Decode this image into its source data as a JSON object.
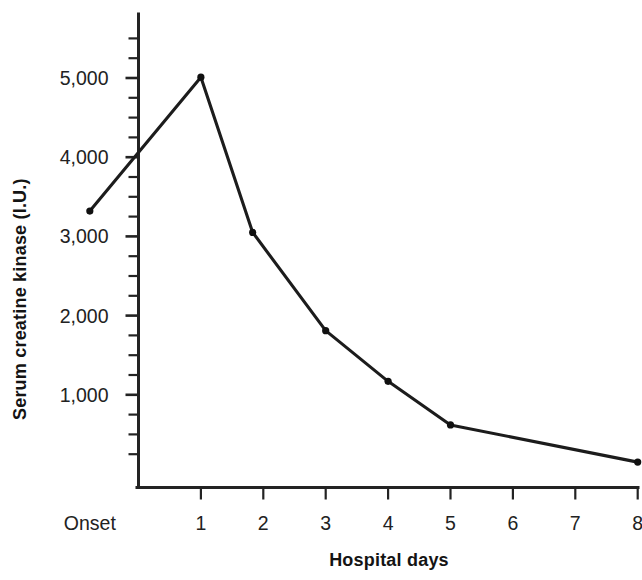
{
  "chart_data": {
    "type": "line",
    "title": "",
    "xlabel": "Hospital days",
    "ylabel": "Serum creatine kinase (I.U.)",
    "xlim": [
      -0.78,
      8.0
    ],
    "ylim": [
      0,
      5550
    ],
    "grid": false,
    "legend": null,
    "x_tick_labels": [
      "Onset",
      "1",
      "2",
      "3",
      "4",
      "5",
      "6",
      "7",
      "8"
    ],
    "x_tick_values": [
      -0.78,
      1,
      2,
      3,
      4,
      5,
      6,
      7,
      8
    ],
    "y_tick_labels": [
      "1,000",
      "2,000",
      "3,000",
      "4,000",
      "5,000"
    ],
    "y_tick_values": [
      1000,
      2000,
      3000,
      4000,
      5000
    ],
    "y_minor_step": 250,
    "series": [
      {
        "name": "Serum creatine kinase",
        "marker": "dot",
        "x": [
          -0.78,
          1.0,
          1.83,
          3.0,
          4.0,
          5.0,
          8.0
        ],
        "y": [
          3320,
          5010,
          3050,
          1810,
          1170,
          620,
          150
        ],
        "x_labels": [
          "Onset",
          "1",
          "1.8",
          "3",
          "4",
          "5",
          "8"
        ]
      }
    ]
  },
  "axes": {
    "y_title": "Serum creatine kinase (I.U.)",
    "x_title": "Hospital days"
  },
  "ticks": {
    "y": [
      {
        "label": "5,000",
        "value": 5000
      },
      {
        "label": "4,000",
        "value": 4000
      },
      {
        "label": "3,000",
        "value": 3000
      },
      {
        "label": "2,000",
        "value": 2000
      },
      {
        "label": "1,000",
        "value": 1000
      }
    ],
    "x": [
      {
        "label": "Onset",
        "value": -0.78
      },
      {
        "label": "1",
        "value": 1
      },
      {
        "label": "2",
        "value": 2
      },
      {
        "label": "3",
        "value": 3
      },
      {
        "label": "4",
        "value": 4
      },
      {
        "label": "5",
        "value": 5
      },
      {
        "label": "6",
        "value": 6
      },
      {
        "label": "7",
        "value": 7
      },
      {
        "label": "8",
        "value": 8
      }
    ]
  },
  "colors": {
    "line": "#1c1c1c",
    "axis": "#232323",
    "text": "#222222",
    "background": "#ffffff"
  }
}
